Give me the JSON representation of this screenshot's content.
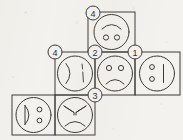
{
  "diagram": {
    "type": "cube-net",
    "background_color": "#f4f2ee",
    "stroke_color": "#3d3a36",
    "face_count": 6,
    "marker_count": 5
  },
  "faces": [
    {
      "id": "face-top",
      "grid": {
        "col": 2,
        "row": 1
      },
      "x": 88,
      "y": 12,
      "w": 47,
      "h": 40,
      "expression": "smile-arc-with-two-eyes",
      "label": "smiling face"
    },
    {
      "id": "face-middle-left",
      "grid": {
        "col": 1,
        "row": 2
      },
      "x": 55,
      "y": 52,
      "w": 40,
      "h": 43,
      "expression": "paren-and-broken-bar",
      "label": "sideways face with closing paren"
    },
    {
      "id": "face-middle-center",
      "grid": {
        "col": 2,
        "row": 2
      },
      "x": 95,
      "y": 52,
      "w": 40,
      "h": 43,
      "expression": "frown-with-two-eyes",
      "label": "sad face"
    },
    {
      "id": "face-middle-right",
      "grid": {
        "col": 3,
        "row": 2
      },
      "x": 135,
      "y": 52,
      "w": 45,
      "h": 43,
      "expression": "two-dots-and-vertical-bar",
      "label": "sideways neutral face"
    },
    {
      "id": "face-bottom-left",
      "grid": {
        "col": 0,
        "row": 3
      },
      "x": 12,
      "y": 95,
      "w": 43,
      "h": 40,
      "expression": "d-shape-and-two-dots",
      "label": "sideways grinning face"
    },
    {
      "id": "face-bottom-right",
      "grid": {
        "col": 1,
        "row": 3
      },
      "x": 55,
      "y": 95,
      "w": 40,
      "h": 40,
      "expression": "angry-brows-and-frown",
      "label": "angry face"
    }
  ],
  "markers": [
    {
      "id": "marker-top",
      "label": "4",
      "cx": 93,
      "cy": 13,
      "r": 7
    },
    {
      "id": "marker-middle-left",
      "label": "4",
      "cx": 55,
      "cy": 52,
      "r": 7
    },
    {
      "id": "marker-middle-mid",
      "label": "2",
      "cx": 95,
      "cy": 52,
      "r": 7
    },
    {
      "id": "marker-middle-right",
      "label": "1",
      "cx": 135,
      "cy": 52,
      "r": 7
    },
    {
      "id": "marker-bottom",
      "label": "3",
      "cx": 95,
      "cy": 95,
      "r": 7
    }
  ]
}
